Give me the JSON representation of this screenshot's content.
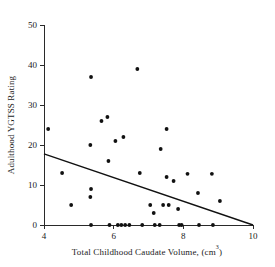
{
  "chart_data": {
    "type": "scatter",
    "title": "",
    "xlabel": "Total Childhood Caudate Volume, (cm³)",
    "xlabel_main": "Total Childhood Caudate Volume, (cm",
    "xlabel_sup": "3",
    "xlabel_tail": ")",
    "ylabel": "Adulthood YGTSS Rating",
    "xlim": [
      4,
      10
    ],
    "ylim": [
      0,
      50
    ],
    "xticks": [
      4,
      6,
      8,
      10
    ],
    "xtick_labels": [
      "4",
      "6",
      "8",
      "10"
    ],
    "yticks": [
      0,
      10,
      20,
      30,
      40,
      50
    ],
    "ytick_labels": [
      "0",
      "10",
      "20",
      "30",
      "40",
      "50"
    ],
    "grid": false,
    "legend": null,
    "marker": "filled-circle",
    "marker_color": "#111111",
    "trend_line": {
      "label": "regression-line",
      "color": "#111111",
      "x_start": 4.0,
      "y_start": 17.8,
      "x_end": 10.0,
      "y_end": 0.0
    },
    "points": [
      {
        "x": 4.12,
        "y": 24
      },
      {
        "x": 4.52,
        "y": 13
      },
      {
        "x": 4.78,
        "y": 5
      },
      {
        "x": 5.33,
        "y": 20
      },
      {
        "x": 5.35,
        "y": 37
      },
      {
        "x": 5.35,
        "y": 9
      },
      {
        "x": 5.33,
        "y": 7
      },
      {
        "x": 5.35,
        "y": 0
      },
      {
        "x": 5.65,
        "y": 26
      },
      {
        "x": 5.82,
        "y": 27
      },
      {
        "x": 5.85,
        "y": 16
      },
      {
        "x": 5.88,
        "y": 0
      },
      {
        "x": 6.05,
        "y": 21
      },
      {
        "x": 6.12,
        "y": 0
      },
      {
        "x": 6.22,
        "y": 0
      },
      {
        "x": 6.28,
        "y": 22
      },
      {
        "x": 6.33,
        "y": 0
      },
      {
        "x": 6.45,
        "y": 0
      },
      {
        "x": 6.68,
        "y": 39
      },
      {
        "x": 6.75,
        "y": 13
      },
      {
        "x": 6.82,
        "y": 0
      },
      {
        "x": 7.05,
        "y": 5
      },
      {
        "x": 7.15,
        "y": 3
      },
      {
        "x": 7.18,
        "y": 0
      },
      {
        "x": 7.35,
        "y": 19
      },
      {
        "x": 7.32,
        "y": 0
      },
      {
        "x": 7.42,
        "y": 5
      },
      {
        "x": 7.52,
        "y": 12
      },
      {
        "x": 7.58,
        "y": 5
      },
      {
        "x": 7.52,
        "y": 24
      },
      {
        "x": 7.72,
        "y": 11
      },
      {
        "x": 7.85,
        "y": 4
      },
      {
        "x": 7.88,
        "y": 0
      },
      {
        "x": 7.95,
        "y": 0
      },
      {
        "x": 8.12,
        "y": 12.8
      },
      {
        "x": 8.42,
        "y": 8
      },
      {
        "x": 8.45,
        "y": 0
      },
      {
        "x": 8.82,
        "y": 12.8
      },
      {
        "x": 8.85,
        "y": 0
      },
      {
        "x": 9.05,
        "y": 6
      }
    ]
  }
}
